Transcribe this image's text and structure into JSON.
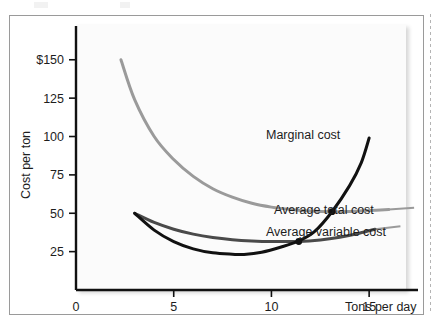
{
  "figure": {
    "kind": "economics-cost-curves-figure"
  },
  "chart_data": {
    "type": "line",
    "title": "",
    "subtitle": "",
    "xlabel": "Tons per day",
    "ylabel": "Cost per ton",
    "xlim": [
      0,
      17.5
    ],
    "ylim": [
      0,
      172
    ],
    "grid": false,
    "legend_position": "right-inline-labels",
    "xticks": [
      0,
      5,
      10,
      15
    ],
    "xtick_labels": [
      "0",
      "5",
      "10",
      "15"
    ],
    "yticks": [
      25,
      50,
      75,
      100,
      125,
      150
    ],
    "ytick_labels": [
      "25",
      "50",
      "75",
      "100",
      "125",
      "$150"
    ],
    "currency_symbol": "$",
    "series": [
      {
        "name": "Marginal cost",
        "label": "Marginal cost",
        "color": "#111111",
        "width": 3.0,
        "x": [
          3.0,
          4.0,
          5.0,
          6.0,
          7.0,
          8.0,
          8.6,
          9.5,
          10.5,
          11.4,
          12.2,
          13.1,
          14.0,
          14.6,
          15.0
        ],
        "y": [
          50.0,
          39.0,
          31.5,
          26.8,
          24.2,
          23.3,
          23.2,
          24.6,
          28.0,
          32.0,
          38.0,
          51.0,
          68.0,
          83.0,
          99.0
        ]
      },
      {
        "name": "Average total cost",
        "label": "Average total cost",
        "color": "#9a9a9a",
        "width": 3.0,
        "x": [
          2.3,
          3.0,
          4.0,
          5.0,
          6.0,
          7.0,
          8.0,
          9.0,
          10.0,
          11.0,
          12.0,
          13.1,
          14.0,
          15.0,
          16.0
        ],
        "y": [
          150.0,
          124.0,
          100.0,
          85.0,
          74.0,
          66.0,
          60.5,
          56.5,
          54.0,
          52.4,
          51.4,
          51.0,
          51.2,
          51.8,
          52.4
        ]
      },
      {
        "name": "Average variable cost",
        "label": "Average variable cost",
        "color": "#4a4a4a",
        "width": 3.0,
        "x": [
          3.0,
          4.0,
          5.0,
          6.0,
          7.0,
          8.0,
          9.0,
          10.0,
          11.4,
          12.5,
          13.5,
          14.5,
          15.3
        ],
        "y": [
          50.0,
          44.0,
          39.6,
          36.4,
          34.2,
          32.8,
          32.0,
          31.6,
          31.6,
          32.6,
          34.4,
          37.0,
          39.6
        ]
      }
    ],
    "annotations": [
      {
        "name": "mc-crosses-atc-minimum",
        "x": 13.1,
        "y": 51.0,
        "marker": "filled-circle"
      },
      {
        "name": "mc-crosses-avc-minimum",
        "x": 11.4,
        "y": 31.6,
        "marker": "filled-circle"
      }
    ],
    "leader_lines": [
      {
        "name": "atc-leader",
        "x1": 16.0,
        "y1": 52.4,
        "x2": 17.3,
        "y2": 53.6
      },
      {
        "name": "avc-leader",
        "x1": 15.3,
        "y1": 39.6,
        "x2": 16.6,
        "y2": 41.5
      }
    ]
  }
}
